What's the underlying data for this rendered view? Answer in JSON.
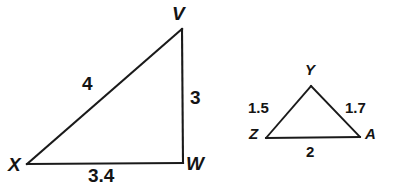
{
  "diagram": {
    "background_color": "#ffffff",
    "stroke_color": "#1a1a1a",
    "text_color": "#141414"
  },
  "figures": [
    {
      "id": "triangle-vxw",
      "name": "large-right-triangle",
      "vertices": [
        {
          "name": "V",
          "label": "V",
          "x": 182,
          "y": 29,
          "label_x": 172,
          "label_y": 4
        },
        {
          "name": "X",
          "label": "X",
          "x": 27,
          "y": 164,
          "label_x": 8,
          "label_y": 155
        },
        {
          "name": "W",
          "label": "W",
          "x": 183,
          "y": 163,
          "label_x": 186,
          "label_y": 154
        }
      ],
      "sides": [
        {
          "name": "XV",
          "length": "4",
          "label_x": 82,
          "label_y": 74
        },
        {
          "name": "VW",
          "length": "3",
          "label_x": 190,
          "label_y": 88
        },
        {
          "name": "XW",
          "length": "3.4",
          "label_x": 88,
          "label_y": 166
        }
      ]
    },
    {
      "id": "triangle-yza",
      "name": "small-triangle",
      "vertices": [
        {
          "name": "Y",
          "label": "Y",
          "x": 311,
          "y": 86,
          "label_x": 305,
          "label_y": 62
        },
        {
          "name": "Z",
          "label": "Z",
          "x": 266,
          "y": 138,
          "label_x": 249,
          "label_y": 126
        },
        {
          "name": "A",
          "label": "A",
          "x": 360,
          "y": 137,
          "label_x": 365,
          "label_y": 126
        }
      ],
      "sides": [
        {
          "name": "ZY",
          "length": "1.5",
          "label_x": 248,
          "label_y": 100
        },
        {
          "name": "YA",
          "length": "1.7",
          "label_x": 345,
          "label_y": 100
        },
        {
          "name": "ZA",
          "length": "2",
          "label_x": 306,
          "label_y": 144
        }
      ]
    }
  ]
}
